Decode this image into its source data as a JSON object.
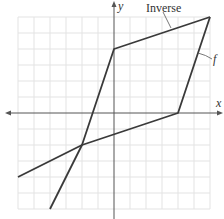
{
  "chart_data": {
    "type": "line",
    "title": "",
    "xlabel": "x",
    "ylabel": "y",
    "xlim": [
      -6,
      6
    ],
    "ylim": [
      -6,
      6
    ],
    "grid": true,
    "grid_step": 1,
    "tick_labels": false,
    "series": [
      {
        "name": "f",
        "label": "f",
        "points": [
          [
            -6,
            -4
          ],
          [
            -2,
            -2
          ],
          [
            4,
            0
          ],
          [
            6,
            6
          ]
        ]
      },
      {
        "name": "Inverse",
        "label": "Inverse",
        "points": [
          [
            -4,
            -6
          ],
          [
            -2,
            -2
          ],
          [
            0,
            4
          ],
          [
            6,
            6
          ]
        ]
      }
    ],
    "annotations": [
      {
        "text": "Inverse",
        "points_to_series": "Inverse"
      },
      {
        "text": "f",
        "points_to_series": "f"
      }
    ]
  },
  "labels": {
    "x_axis": "x",
    "y_axis": "y",
    "inverse": "Inverse",
    "f": "f"
  },
  "colors": {
    "curve": "#3a3a3a",
    "axis": "#555555",
    "grid": "#e3e3e3"
  }
}
